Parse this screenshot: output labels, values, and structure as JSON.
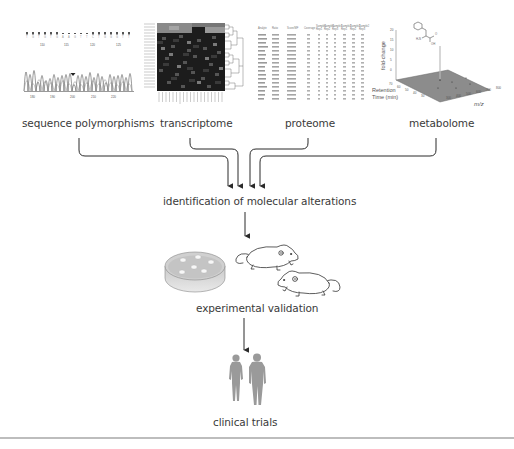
{
  "panels": {
    "sequence": {
      "label": "sequence polymorphisms",
      "position_labels": [
        "110",
        "115",
        "120",
        "125"
      ],
      "axis_ticks": [
        "180",
        "190",
        "200",
        "210",
        "220"
      ]
    },
    "transcriptome": {
      "label": "transcriptome"
    },
    "proteome": {
      "label": "proteome",
      "table_headers": [
        "Analyte",
        "Ratio",
        "Score/MF",
        "Coverage",
        "Sample1 Rep1",
        "Sample1 Rep2",
        "Sample1 Rep3",
        "Sample2 Rep1",
        "Sample2 Rep2",
        "Sample2 Rep3"
      ]
    },
    "metabolome": {
      "label": "metabolome",
      "z_axis_label": "fold-change",
      "z_ticks": [
        "0",
        "5",
        "10",
        "15",
        "20"
      ],
      "y_axis_label": "Retention Time (min)",
      "y_ticks": [
        "70",
        "60",
        "50",
        "40",
        "30"
      ],
      "x_axis_label": "m/z",
      "x_ticks": [
        "300",
        "400",
        "500",
        "600",
        "700",
        "800"
      ]
    }
  },
  "flow": {
    "step1": "identification of molecular alterations",
    "step2": "experimental validation",
    "step3": "clinical trials"
  },
  "colors": {
    "text": "#3a3a3a",
    "arrow": "#2a2a2a",
    "figure_gray": "#9a9a9a",
    "divider": "#bdbdbd"
  }
}
